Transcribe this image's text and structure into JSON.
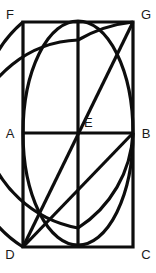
{
  "figure": {
    "type": "geometry-diagram",
    "background_color": "#ffffff",
    "stroke_color": "#0d0d0d",
    "label_color": "#1a1a1a",
    "stroke_width": 3.2,
    "canvas": {
      "width": 156,
      "height": 273
    }
  },
  "labels": {
    "f": "F",
    "g": "G",
    "a": "A",
    "e": "E",
    "b": "B",
    "d": "D",
    "c": "C"
  },
  "points": {
    "F": {
      "x": 23,
      "y": 22
    },
    "G": {
      "x": 133,
      "y": 22
    },
    "A": {
      "x": 23,
      "y": 133
    },
    "E": {
      "x": 78,
      "y": 133
    },
    "B": {
      "x": 133,
      "y": 133
    },
    "D": {
      "x": 23,
      "y": 247
    },
    "C": {
      "x": 133,
      "y": 247
    },
    "TOP_MID": {
      "x": 78,
      "y": 22
    },
    "BOT_MID": {
      "x": 78,
      "y": 247
    }
  },
  "label_positions": {
    "f": {
      "x": 10,
      "y": 16
    },
    "g": {
      "x": 146,
      "y": 16
    },
    "a": {
      "x": 10,
      "y": 135
    },
    "e": {
      "x": 84,
      "y": 124
    },
    "b": {
      "x": 146,
      "y": 135
    },
    "d": {
      "x": 10,
      "y": 256
    },
    "c": {
      "x": 146,
      "y": 256
    }
  },
  "shapes": {
    "rectangle": "M 23 22 L 133 22 L 133 247 L 23 247 Z",
    "midline_ab": "M 23 133 L 133 133",
    "vertical_center": "M 78 22 L 78 247",
    "ellipse": {
      "cx": 78,
      "cy": 133,
      "rx": 55,
      "ry": 112
    },
    "arc_left_top": "M 23 247 A 112 112 0 0 1 78 40",
    "arc_top_cross_right": "M 133 22 A 140 140 0 0 0 78 40",
    "arc_bottom_left": "M 23 22 A 118 118 0 0 0 78 228",
    "arc_bottom_right": "M 133 133 A 120 120 0 0 1 78 228",
    "diagonal_d_g": "M 23 247 L 133 22",
    "diagonal_d_b": "M 23 247 L 133 133",
    "diagonal_d_e_g": "M 23 247 L 78 133"
  },
  "chart_data": {
    "type": "table",
    "vertices": [
      {
        "name": "F",
        "x": 23,
        "y": 22,
        "role": "top-left corner"
      },
      {
        "name": "G",
        "x": 133,
        "y": 22,
        "role": "top-right corner"
      },
      {
        "name": "A",
        "x": 23,
        "y": 133,
        "role": "left midpoint"
      },
      {
        "name": "E",
        "x": 78,
        "y": 133,
        "role": "center"
      },
      {
        "name": "B",
        "x": 133,
        "y": 133,
        "role": "right midpoint"
      },
      {
        "name": "D",
        "x": 23,
        "y": 247,
        "role": "bottom-left corner"
      },
      {
        "name": "C",
        "x": 133,
        "y": 247,
        "role": "bottom-right corner"
      }
    ],
    "segments": [
      "FG",
      "GC",
      "CD",
      "DF",
      "AB",
      "vertical FD-midline",
      "DG",
      "DB",
      "DE"
    ]
  }
}
